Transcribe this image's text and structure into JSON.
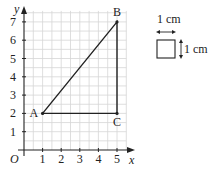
{
  "chart_data": {
    "type": "line",
    "title": "",
    "xlabel": "x",
    "ylabel": "y",
    "origin_label": "O",
    "xlim": [
      0,
      5.5
    ],
    "ylim": [
      0,
      7.6
    ],
    "xticks": [
      "1",
      "2",
      "3",
      "4",
      "5"
    ],
    "yticks": [
      "1",
      "2",
      "3",
      "4",
      "5",
      "6",
      "7"
    ],
    "grid": true,
    "points": [
      {
        "name": "A",
        "x": 1,
        "y": 2
      },
      {
        "name": "B",
        "x": 5,
        "y": 7
      },
      {
        "name": "C",
        "x": 5,
        "y": 2
      }
    ],
    "polygon": [
      "A",
      "B",
      "C"
    ]
  },
  "scale_key": {
    "width_label": "1 cm",
    "height_label": "1 cm"
  }
}
